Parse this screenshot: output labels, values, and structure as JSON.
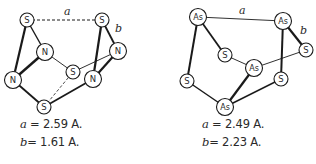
{
  "molecules": [
    {
      "name": "S4N4",
      "atoms": [
        {
          "id": "s1",
          "label": "S",
          "x": 27,
          "y": 20,
          "r": 7
        },
        {
          "id": "s2",
          "label": "S",
          "x": 102,
          "y": 20,
          "r": 7
        },
        {
          "id": "n1",
          "label": "N",
          "x": 45,
          "y": 52,
          "r": 8.5
        },
        {
          "id": "n2",
          "label": "N",
          "x": 118,
          "y": 51,
          "r": 8.5
        },
        {
          "id": "s3",
          "label": "S",
          "x": 73,
          "y": 72,
          "r": 7
        },
        {
          "id": "n3",
          "label": "N",
          "x": 13,
          "y": 80,
          "r": 8.5
        },
        {
          "id": "n4",
          "label": "N",
          "x": 93,
          "y": 79,
          "r": 8.5
        },
        {
          "id": "s4",
          "label": "S",
          "x": 44,
          "y": 107,
          "r": 7
        }
      ],
      "bonds": [
        {
          "a": "s1",
          "b": "s2",
          "style": "dashed",
          "w": 1
        },
        {
          "a": "s1",
          "b": "n3",
          "style": "solid",
          "w": 2.2
        },
        {
          "a": "s1",
          "b": "n1",
          "style": "solid",
          "w": 1.4
        },
        {
          "a": "n1",
          "b": "n3",
          "style": "solid",
          "w": 2.4
        },
        {
          "a": "n1",
          "b": "s3",
          "style": "solid",
          "w": 0.9
        },
        {
          "a": "n3",
          "b": "s4",
          "style": "solid",
          "w": 1.8
        },
        {
          "a": "s4",
          "b": "s3",
          "style": "dashed",
          "w": 0.8
        },
        {
          "a": "s4",
          "b": "n4",
          "style": "solid",
          "w": 1.8
        },
        {
          "a": "s3",
          "b": "n2",
          "style": "solid",
          "w": 0.9
        },
        {
          "a": "s2",
          "b": "n4",
          "style": "solid",
          "w": 2.2
        },
        {
          "a": "s2",
          "b": "n2",
          "style": "solid",
          "w": 1.8
        },
        {
          "a": "n2",
          "b": "n4",
          "style": "solid",
          "w": 2.2
        }
      ],
      "bond_labels": [
        {
          "text": "a",
          "x": 64,
          "y": 15
        },
        {
          "text": "b",
          "x": 115,
          "y": 32
        }
      ],
      "captions": [
        {
          "var": "a",
          "text": " = 2.59 A.",
          "x": 20,
          "y": 124
        },
        {
          "var": "b",
          "text": "= 1.61 A.",
          "x": 20,
          "y": 142
        }
      ]
    },
    {
      "name": "As4S4",
      "atoms": [
        {
          "id": "as1",
          "label": "As",
          "x": 198,
          "y": 17,
          "r": 8.5
        },
        {
          "id": "as2",
          "label": "As",
          "x": 283,
          "y": 21,
          "r": 8.5
        },
        {
          "id": "sa",
          "label": "S",
          "x": 225,
          "y": 55,
          "r": 7
        },
        {
          "id": "sb",
          "label": "S",
          "x": 306,
          "y": 50,
          "r": 7
        },
        {
          "id": "as3",
          "label": "As",
          "x": 254,
          "y": 68,
          "r": 8.5
        },
        {
          "id": "sc",
          "label": "S",
          "x": 187,
          "y": 81,
          "r": 7
        },
        {
          "id": "sd",
          "label": "S",
          "x": 281,
          "y": 79,
          "r": 7
        },
        {
          "id": "as4",
          "label": "As",
          "x": 225,
          "y": 107,
          "r": 8.5
        }
      ],
      "bonds": [
        {
          "a": "as1",
          "b": "as2",
          "style": "solid",
          "w": 0.9
        },
        {
          "a": "as1",
          "b": "sc",
          "style": "solid",
          "w": 2.0
        },
        {
          "a": "as1",
          "b": "sa",
          "style": "solid",
          "w": 1.8
        },
        {
          "a": "sa",
          "b": "as3",
          "style": "solid",
          "w": 0.9
        },
        {
          "a": "as3",
          "b": "sb",
          "style": "solid",
          "w": 0.9
        },
        {
          "a": "as3",
          "b": "as4",
          "style": "solid",
          "w": 2.2
        },
        {
          "a": "sc",
          "b": "as4",
          "style": "solid",
          "w": 1.5
        },
        {
          "a": "as4",
          "b": "sd",
          "style": "solid",
          "w": 1.5
        },
        {
          "a": "as2",
          "b": "sd",
          "style": "solid",
          "w": 2.0
        },
        {
          "a": "as2",
          "b": "sb",
          "style": "solid",
          "w": 2.2
        }
      ],
      "bond_labels": [
        {
          "text": "a",
          "x": 239,
          "y": 14
        },
        {
          "text": "b",
          "x": 300,
          "y": 34
        }
      ],
      "captions": [
        {
          "var": "a",
          "text": " = 2.49 A.",
          "x": 202,
          "y": 124
        },
        {
          "var": "b",
          "text": "= 2.23 A.",
          "x": 202,
          "y": 142
        }
      ]
    }
  ],
  "colors": {
    "line": "#1a1a1a",
    "atom_fill": "#ffffff",
    "text": "#2a2a2a"
  }
}
